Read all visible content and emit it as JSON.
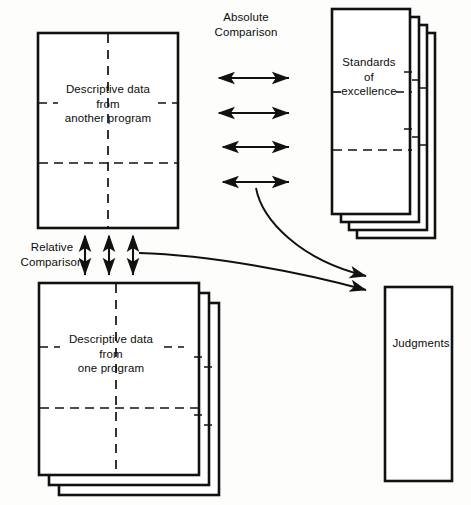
{
  "diagram": {
    "stroke_color": "#111111",
    "background_color": "#fdfdfc",
    "nodes": {
      "another_program": {
        "label": "Descriptive data\nfrom\nanother program",
        "shape": "single-card",
        "has_dashed_grid": true
      },
      "one_program": {
        "label": "Descriptive data\nfrom\none program",
        "shape": "card-stack",
        "stack_count": 3,
        "has_dashed_grid": true
      },
      "standards": {
        "label": "Standards\nof\nexcellence",
        "shape": "card-stack",
        "stack_count": 4,
        "has_dashed_grid": true
      },
      "judgments": {
        "label": "Judgments",
        "shape": "single-card",
        "has_dashed_grid": false
      }
    },
    "connectors": {
      "absolute_comparison": {
        "label": "Absolute\nComparison",
        "style": "double-headed",
        "orientation": "horizontal",
        "count": 4
      },
      "relative_comparison": {
        "label": "Relative\nComparison",
        "style": "double-headed",
        "orientation": "vertical",
        "count": 3
      },
      "to_judgments": {
        "label": "",
        "style": "single-headed-curve",
        "count": 2
      }
    }
  }
}
